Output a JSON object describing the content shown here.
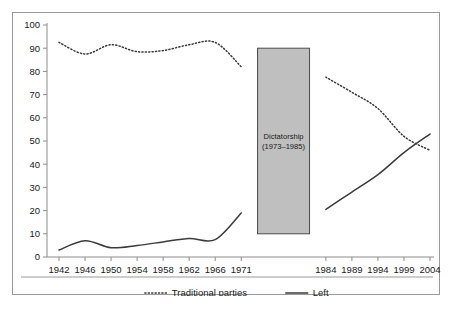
{
  "figure": {
    "title": "",
    "band": {
      "label_line1": "Dictatorship",
      "label_line2": "(1973–1985)",
      "start_year": 1973,
      "end_year": 1985,
      "fill_color": "#bfbfbf",
      "border_color": "#4a4a4a",
      "top_value": 90,
      "bottom_value": 10
    },
    "frame_border_color": "#9a9a9a",
    "axis_color": "#8c8c8c",
    "line_color": "#3b3b3b",
    "background_color": "#ffffff"
  },
  "chart_data": {
    "type": "line",
    "title": "",
    "xlabel": "",
    "ylabel": "",
    "ylim": [
      0,
      100
    ],
    "ytick_step": 10,
    "yticks": [
      0,
      10,
      20,
      30,
      40,
      50,
      60,
      70,
      80,
      90,
      100
    ],
    "categories": [
      "1942",
      "1946",
      "1950",
      "1954",
      "1958",
      "1962",
      "1966",
      "1971",
      "1984",
      "1989",
      "1994",
      "1999",
      "2004"
    ],
    "x": [
      1942,
      1946,
      1950,
      1954,
      1958,
      1962,
      1966,
      1971,
      1984,
      1989,
      1994,
      1999,
      2004
    ],
    "grid": false,
    "legend_position": "bottom",
    "series": [
      {
        "name": "Traditional parties",
        "style": "dashed",
        "values": [
          92.5,
          87.5,
          91.5,
          88.5,
          89.0,
          91.5,
          92.5,
          82.0,
          77.5,
          71.0,
          64.0,
          52.0,
          46.0
        ]
      },
      {
        "name": "Left",
        "style": "solid",
        "values": [
          3.0,
          7.0,
          4.0,
          5.0,
          6.5,
          8.0,
          7.5,
          19.0,
          20.5,
          28.0,
          35.5,
          45.0,
          53.0
        ]
      }
    ],
    "break_after_category": "1971",
    "annotations": [
      {
        "text": "Dictatorship (1973–1985)",
        "x_start": 1973,
        "x_end": 1985,
        "y_top": 90,
        "y_bottom": 10
      }
    ]
  },
  "legend": {
    "items": [
      {
        "label": "Traditional parties",
        "style": "dashed"
      },
      {
        "label": "Left",
        "style": "solid"
      }
    ]
  }
}
